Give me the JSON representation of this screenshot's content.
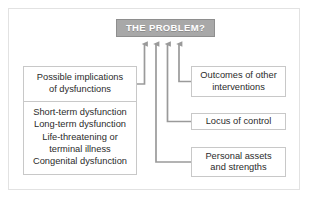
{
  "diagram": {
    "title_box": {
      "label": "THE PROBLEM?",
      "fill_color": "#a8a8a8",
      "text_color": "#ffffff"
    },
    "left_box": {
      "header": "Possible implications\nof dysfunctions",
      "items": [
        "Short-term dysfunction",
        "Long-term dysfunction",
        "Life-threatening or\nterminal illness",
        "Congenital dysfunction"
      ]
    },
    "right_boxes": [
      {
        "label": "Outcomes of other\ninterventions"
      },
      {
        "label": "Locus of control"
      },
      {
        "label": "Personal assets\nand strengths"
      }
    ],
    "connectors": {
      "count": 4,
      "arrow_color": "#9a9a9a",
      "description": "four elbow arrows pointing up into the title box"
    },
    "frame_color": "#e2e2e2",
    "box_border_color": "#c8c8c8",
    "text_color": "#2b2b2b"
  }
}
